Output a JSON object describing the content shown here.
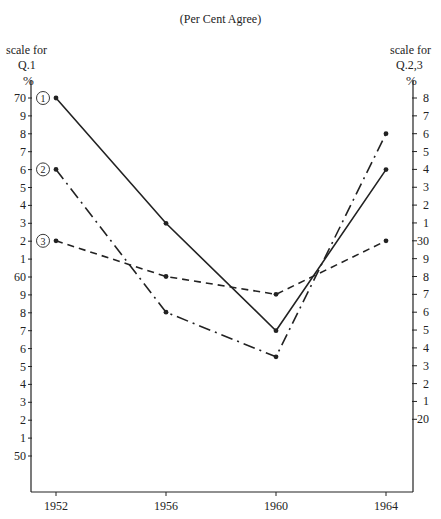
{
  "chart_data": {
    "type": "line",
    "title": "(Per Cent Agree)",
    "xlabel": "",
    "x": [
      1952,
      1956,
      1960,
      1964
    ],
    "x_tick_labels": [
      "1952",
      "1956",
      "1960",
      "1964"
    ],
    "left_axis": {
      "label_lines": [
        "scale for",
        "Q.1",
        "%"
      ],
      "ylim": [
        50,
        70
      ],
      "tick_values": [
        70,
        69,
        68,
        67,
        66,
        65,
        64,
        63,
        62,
        61,
        60,
        59,
        58,
        57,
        56,
        55,
        54,
        53,
        52,
        51,
        50
      ],
      "tick_labels": [
        "70",
        "9",
        "8",
        "7",
        "6",
        "5",
        "4",
        "3",
        "2",
        "1",
        "60",
        "9",
        "8",
        "7",
        "6",
        "5",
        "4",
        "3",
        "2",
        "1",
        "50"
      ]
    },
    "right_axis": {
      "label_lines": [
        "scale for",
        "Q.2,3",
        "%"
      ],
      "ylim": [
        20,
        38
      ],
      "tick_values": [
        38,
        37,
        36,
        35,
        34,
        33,
        32,
        31,
        30,
        29,
        28,
        27,
        26,
        25,
        24,
        23,
        22,
        21,
        20
      ],
      "tick_labels": [
        "8",
        "7",
        "6",
        "5",
        "4",
        "3",
        "2",
        "1",
        "30",
        "9",
        "8",
        "7",
        "6",
        "5",
        "4",
        "3",
        "2",
        "1",
        "20"
      ]
    },
    "series": [
      {
        "name": "1",
        "marker_label": "1",
        "axis": "left",
        "style": "solid",
        "values": [
          70,
          63,
          57,
          66
        ]
      },
      {
        "name": "2",
        "marker_label": "2",
        "axis": "right",
        "style": "dashdot",
        "values": [
          34,
          26,
          23.5,
          36
        ]
      },
      {
        "name": "3",
        "marker_label": "3",
        "axis": "right",
        "style": "dashed",
        "values": [
          30,
          28,
          27,
          30
        ]
      }
    ],
    "grid": false,
    "legend": "circled numbers at left of series start"
  },
  "colors": {
    "ink": "#222222",
    "background": "#ffffff"
  }
}
